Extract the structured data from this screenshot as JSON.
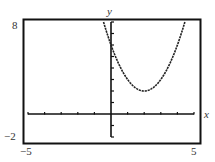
{
  "chart_data": {
    "type": "line",
    "title": "",
    "xlabel": "x",
    "ylabel": "y",
    "xlim": [
      -5,
      5
    ],
    "ylim": [
      -2,
      8
    ],
    "x_tick_step": 1,
    "y_tick_step": 1,
    "grid": false,
    "legend": null,
    "corner_labels": {
      "ymax": "8",
      "ymin": "−2",
      "xmin": "−5",
      "xmax": "5"
    },
    "series": [
      {
        "name": "parabola",
        "equation_estimate": "y = (x - 2)^2 + 2",
        "vertex": [
          2,
          2
        ],
        "y_intercept": 6,
        "x": [
          -0.45,
          0,
          0.5,
          1,
          1.5,
          2,
          2.5,
          3,
          3.5,
          4,
          4.45
        ],
        "y": [
          8,
          6,
          4.25,
          3,
          2.25,
          2,
          2.25,
          3,
          4.25,
          6,
          8
        ]
      }
    ]
  }
}
